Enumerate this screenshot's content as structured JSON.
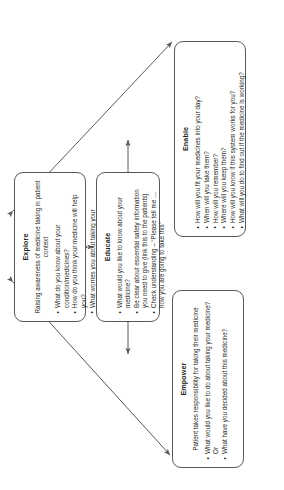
{
  "diagram": {
    "type": "flow-diagram",
    "orientation": "rotated-90-ccw",
    "line_color": "#58595b",
    "text_color": "#231f20",
    "background": "#ffffff",
    "boxes": [
      {
        "id": "explore",
        "title": "Explore",
        "subtitle": "Raising awareness of medicine taking in patient context",
        "bullets": [
          "What do you know about your condition/medicines?",
          "How do you think your medicine will help you?",
          "What worries you about taking your medicine?",
          "What do you hope your medicine will allow you to do?"
        ]
      },
      {
        "id": "educate",
        "title": "Educate",
        "subtitle": "",
        "bullets": [
          "What would you like to know about your medicine?",
          "Be clear about essential safety information you need to give (link this to the patients)",
          "Check understanding – “Please tell me … how you are going to take this”"
        ]
      },
      {
        "id": "enable",
        "title": "Enable",
        "subtitle": "",
        "bullets": [
          "How will you fit your medicines into your day?",
          "When will you take them?",
          "How will you remember?",
          "Where will you keep them?",
          "How will you know if this system works for you?",
          "What will you do to find out if the medicine is working?"
        ]
      },
      {
        "id": "empower",
        "title": "Empower",
        "subtitle": "Patient takes responsibility for taking their medicine",
        "bullets": [
          "What would you like to do about taking your medicine? Or",
          "What have you decided about this medicine?"
        ]
      }
    ],
    "connections": [
      {
        "id": "explore-educate",
        "from": "explore",
        "to": "educate",
        "arrows": "both"
      },
      {
        "id": "educate-enable",
        "from": "educate",
        "to": "enable",
        "arrows": "both"
      },
      {
        "id": "educate-empower",
        "from": "educate",
        "to": "empower",
        "arrows": "both"
      },
      {
        "id": "explore-enable",
        "from": "explore",
        "to": "enable",
        "arrows": "both"
      },
      {
        "id": "explore-empower",
        "from": "explore",
        "to": "empower",
        "arrows": "both"
      }
    ]
  }
}
